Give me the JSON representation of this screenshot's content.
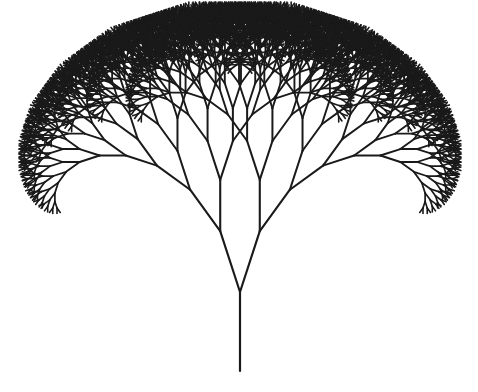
{
  "figure": {
    "title": "Fractal tree",
    "background": "#ffffff",
    "stroke_color": "#1a1a1a"
  },
  "tree": {
    "trunk_base": [
      240,
      371
    ],
    "trunk_length": 79,
    "first_branch_length": 64,
    "length_ratio": 0.8,
    "branch_angle_deg": 18,
    "depth": 12,
    "stroke_width": 2.2,
    "min_stroke_width": 1.6
  }
}
